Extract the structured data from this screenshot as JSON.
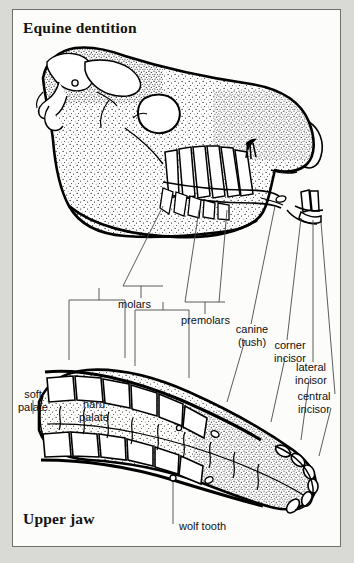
{
  "figure": {
    "title_top": "Equine dentition",
    "title_bottom": "Upper jaw",
    "background": "#fcfcfa",
    "frame_color": "#6f6f6f",
    "ink_color": "#000000",
    "page_margin_color": "#d9d9d6"
  },
  "labels": {
    "molars": "molars",
    "premolars": "premolars",
    "canine_line1": "canine",
    "canine_line2": "(tush)",
    "corner_incisor_line1": "corner",
    "corner_incisor_line2": "incisor",
    "lateral_incisor_line1": "lateral",
    "lateral_incisor_line2": "incisor",
    "central_incisor_line1": "central",
    "central_incisor_line2": "incisor",
    "soft_palate_line1": "soft",
    "soft_palate_line2": "palate",
    "hard_palate_line1": "hard",
    "hard_palate_line2": "palate",
    "wolf_tooth": "wolf tooth"
  },
  "diagram": {
    "upper_view": "lateral view of equine skull with stippled bone shading showing cheek teeth roots and crowns",
    "lower_view": "occlusal (ventral) view of the upper jaw showing both tooth rows, palate ridges and incisor arcade",
    "arrow_marker": "arrowhead indicating wolf tooth position on skull"
  }
}
